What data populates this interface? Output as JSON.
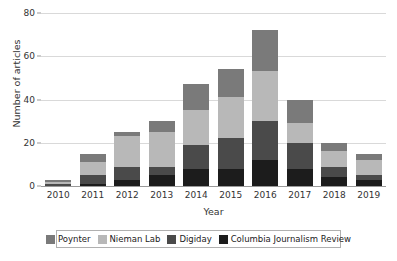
{
  "chart_data": {
    "type": "bar",
    "stacked": true,
    "title": "",
    "xlabel": "Year",
    "ylabel": "Number of articles",
    "ylim": [
      0,
      80
    ],
    "yticks": [
      0,
      20,
      40,
      60,
      80
    ],
    "grid": true,
    "legend_position": "bottom",
    "categories": [
      "2010",
      "2011",
      "2012",
      "2013",
      "2014",
      "2015",
      "2016",
      "2017",
      "2018",
      "2019"
    ],
    "series": [
      {
        "name": "Poynter",
        "color": "#7a7a7a",
        "values": [
          1,
          4,
          2,
          5,
          12,
          13,
          19,
          11,
          4,
          3
        ]
      },
      {
        "name": "Nieman Lab",
        "color": "#b8b8b8",
        "values": [
          1,
          6,
          14,
          16,
          16,
          19,
          23,
          9,
          7,
          7
        ]
      },
      {
        "name": "Digiday",
        "color": "#4a4a4a",
        "values": [
          1,
          4,
          6,
          4,
          11,
          14,
          18,
          12,
          5,
          2
        ]
      },
      {
        "name": "Columbia Journalism Review",
        "color": "#1c1c1c",
        "values": [
          0,
          1,
          3,
          5,
          8,
          8,
          12,
          8,
          4,
          3
        ]
      }
    ],
    "totals": [
      3,
      15,
      25,
      30,
      47,
      54,
      72,
      40,
      20,
      15
    ]
  },
  "axes": {
    "y_title": "Number of articles",
    "x_title": "Year"
  }
}
